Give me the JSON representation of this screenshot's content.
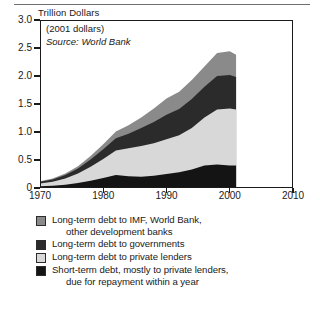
{
  "chart_data": {
    "type": "area",
    "stacked": true,
    "title": "",
    "unit_title": "Trillion Dollars",
    "xlabel": "",
    "ylabel": "Trillion Dollars",
    "xlim": [
      1970,
      2010
    ],
    "ylim": [
      0.0,
      3.0
    ],
    "yticks": [
      "0",
      "0.5",
      "1.0",
      "1.5",
      "2.0",
      "2.5",
      "3.0"
    ],
    "ytick_values": [
      0.0,
      0.5,
      1.0,
      1.5,
      2.0,
      2.5,
      3.0
    ],
    "xticks": [
      "1970",
      "1980",
      "1990",
      "2000",
      "2010"
    ],
    "xtick_values": [
      1970,
      1980,
      1990,
      2000,
      2010
    ],
    "grid": false,
    "legend_position": "below",
    "annotations": [
      "(2001 dollars)",
      "Source: World Bank"
    ],
    "x": [
      1970,
      1972,
      1974,
      1976,
      1978,
      1980,
      1982,
      1984,
      1986,
      1988,
      1990,
      1992,
      1994,
      1996,
      1998,
      2000,
      2001
    ],
    "series": [
      {
        "name": "Short-term debt, mostly to private lenders, due for repayment within a year",
        "color": "#141414",
        "values": [
          0.03,
          0.04,
          0.06,
          0.09,
          0.13,
          0.18,
          0.23,
          0.21,
          0.2,
          0.22,
          0.25,
          0.28,
          0.33,
          0.4,
          0.42,
          0.4,
          0.4
        ]
      },
      {
        "name": "Long-term debt to private lenders",
        "color": "#d8d8d8",
        "values": [
          0.05,
          0.07,
          0.11,
          0.17,
          0.25,
          0.34,
          0.44,
          0.5,
          0.55,
          0.58,
          0.62,
          0.66,
          0.74,
          0.86,
          0.98,
          1.02,
          1.0
        ]
      },
      {
        "name": "Long-term debt to governments",
        "color": "#2b2b2b",
        "values": [
          0.03,
          0.04,
          0.06,
          0.09,
          0.13,
          0.17,
          0.22,
          0.26,
          0.32,
          0.38,
          0.44,
          0.47,
          0.52,
          0.55,
          0.6,
          0.6,
          0.58
        ]
      },
      {
        "name": "Long-term debt to IMF, World Bank, other development banks",
        "color": "#8a8a8a",
        "values": [
          0.01,
          0.02,
          0.03,
          0.04,
          0.06,
          0.09,
          0.12,
          0.15,
          0.19,
          0.24,
          0.29,
          0.31,
          0.34,
          0.36,
          0.41,
          0.42,
          0.4
        ]
      }
    ]
  },
  "legend": {
    "items": [
      {
        "color": "#8a8a8a",
        "line1": "Long-term debt to IMF, World Bank,",
        "line2": "other development banks"
      },
      {
        "color": "#2b2b2b",
        "line1": "Long-term debt to governments",
        "line2": ""
      },
      {
        "color": "#d8d8d8",
        "line1": "Long-term debt to private lenders",
        "line2": ""
      },
      {
        "color": "#141414",
        "line1": "Short-term debt, mostly to private lenders,",
        "line2": "due for repayment within a year"
      }
    ]
  }
}
